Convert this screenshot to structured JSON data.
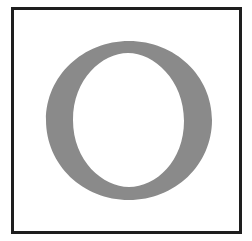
{
  "tile": {
    "letter": "O",
    "colors": {
      "background": "#ffffff",
      "border": "#1e1e1e",
      "letter": "#8a8a8a"
    }
  }
}
